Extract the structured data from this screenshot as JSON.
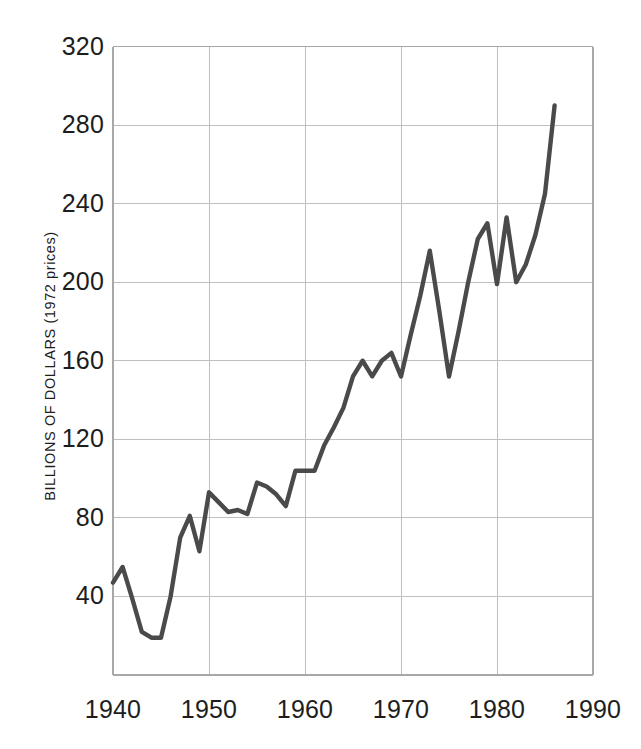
{
  "chart_data": {
    "type": "line",
    "title": "",
    "xlabel": "",
    "ylabel": "BILLIONS OF DOLLARS (1972 prices)",
    "xlim": [
      1940,
      1990
    ],
    "ylim": [
      0,
      320
    ],
    "xticks": [
      1940,
      1950,
      1960,
      1970,
      1980,
      1990
    ],
    "xtick_labels": [
      "1940",
      "1950",
      "1960",
      "1970",
      "1980",
      "1990"
    ],
    "yticks": [
      40,
      80,
      120,
      160,
      200,
      240,
      280,
      320
    ],
    "ytick_labels": [
      "40",
      "80",
      "120",
      "160",
      "200",
      "240",
      "280",
      "320"
    ],
    "grid": true,
    "legend": null,
    "line_color": "#4a4a4a",
    "line_width": 4.4,
    "grid_color": "#bfbfbf",
    "axis_color": "#a8a8a8",
    "background": "#ffffff",
    "x": [
      1940,
      1941,
      1942,
      1943,
      1944,
      1945,
      1946,
      1947,
      1948,
      1949,
      1950,
      1951,
      1952,
      1953,
      1954,
      1955,
      1956,
      1957,
      1958,
      1959,
      1960,
      1961,
      1962,
      1963,
      1964,
      1965,
      1966,
      1967,
      1968,
      1969,
      1970,
      1971,
      1972,
      1973,
      1974,
      1975,
      1976,
      1977,
      1978,
      1979,
      1980,
      1981,
      1982,
      1983,
      1984,
      1985,
      1986
    ],
    "y": [
      47,
      55,
      39,
      22,
      19,
      19,
      40,
      70,
      81,
      63,
      93,
      88,
      83,
      84,
      82,
      98,
      96,
      92,
      86,
      104,
      104,
      104,
      117,
      126,
      136,
      152,
      160,
      152,
      160,
      164,
      152,
      173,
      193,
      216,
      185,
      152,
      175,
      200,
      222,
      230,
      199,
      233,
      200,
      209,
      224,
      245,
      290
    ],
    "series": [
      {
        "name": "series-1",
        "values": [
          47,
          55,
          39,
          22,
          19,
          19,
          40,
          70,
          81,
          63,
          93,
          88,
          83,
          84,
          82,
          98,
          96,
          92,
          86,
          104,
          104,
          104,
          117,
          126,
          136,
          152,
          160,
          152,
          160,
          164,
          152,
          173,
          193,
          216,
          185,
          152,
          175,
          200,
          222,
          230,
          199,
          233,
          200,
          209,
          224,
          245,
          290
        ]
      }
    ]
  },
  "axis": {
    "y_label": "BILLIONS OF DOLLARS (1972 prices)",
    "y_ticks": [
      "320",
      "280",
      "240",
      "200",
      "160",
      "120",
      "80",
      "40"
    ],
    "x_ticks": [
      "1940",
      "1950",
      "1960",
      "1970",
      "1980",
      "1990"
    ]
  }
}
